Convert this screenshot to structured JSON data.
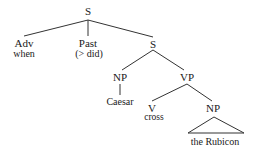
{
  "tree": {
    "root": {
      "label": "S"
    },
    "adv": {
      "label": "Adv",
      "word": "when"
    },
    "past": {
      "label": "Past",
      "word": "(> did)"
    },
    "s_inner": {
      "label": "S"
    },
    "np_subj": {
      "label": "NP",
      "word": "Caesar"
    },
    "vp": {
      "label": "VP"
    },
    "v": {
      "label": "V",
      "word": "cross"
    },
    "np_obj": {
      "label": "NP",
      "word": "the Rubicon",
      "rendering": "triangle"
    }
  },
  "edges": [
    [
      "S",
      "Adv"
    ],
    [
      "S",
      "Past"
    ],
    [
      "S",
      "S"
    ],
    [
      "S",
      "NP"
    ],
    [
      "S",
      "VP"
    ],
    [
      "NP",
      "Caesar"
    ],
    [
      "VP",
      "V"
    ],
    [
      "VP",
      "NP"
    ],
    [
      "NP",
      "the Rubicon (triangle)"
    ]
  ],
  "colors": {
    "line": "#333333",
    "text": "#1a1a1a",
    "background": "#ffffff"
  }
}
